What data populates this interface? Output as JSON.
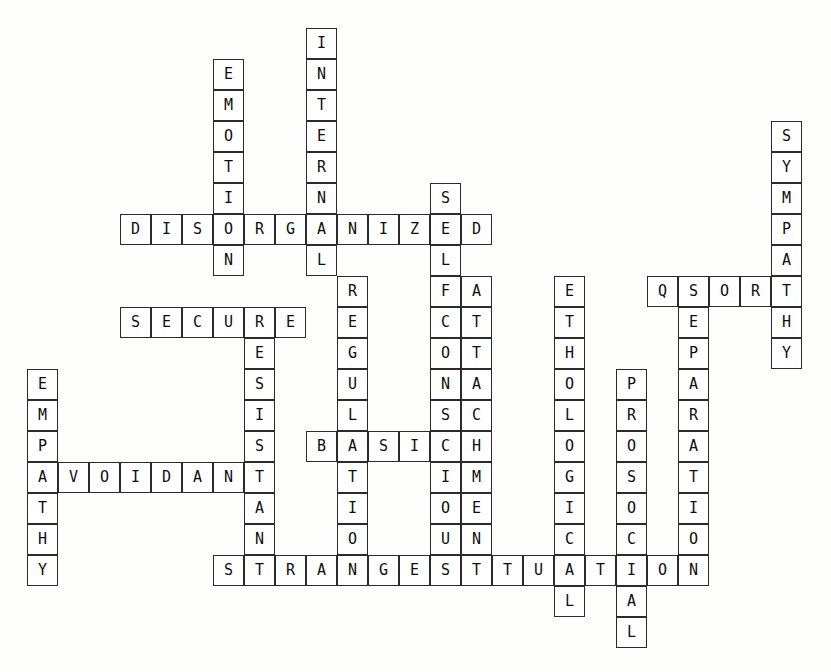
{
  "puzzle": {
    "kind": "crossword-grid",
    "title": "Attachment Theory Crossword",
    "cell_size": 31,
    "origin_x": 27,
    "origin_y": 28,
    "cols": 26,
    "rows": 20,
    "colors": {
      "page_background": "#fdfdfc",
      "cell_background": "#ffffff",
      "cell_border": "#2b2b2b",
      "letter_color": "#0d0d0d"
    },
    "entries": [
      {
        "answer": "INTERNAL",
        "direction": "down",
        "row": 0,
        "col": 9
      },
      {
        "answer": "EMOTION",
        "direction": "down",
        "row": 1,
        "col": 6
      },
      {
        "answer": "SELFCONSCIOUS",
        "direction": "down",
        "row": 5,
        "col": 13
      },
      {
        "answer": "DISORGANIZED",
        "direction": "across",
        "row": 6,
        "col": 3
      },
      {
        "answer": "SYMPATHY",
        "direction": "down",
        "row": 3,
        "col": 24
      },
      {
        "answer": "QSORT",
        "direction": "across",
        "row": 8,
        "col": 20
      },
      {
        "answer": "SEPARATION",
        "direction": "down",
        "row": 8,
        "col": 21
      },
      {
        "answer": "ATTACHMENT",
        "direction": "down",
        "row": 8,
        "col": 14
      },
      {
        "answer": "ETHOLOGICAL",
        "direction": "down",
        "row": 8,
        "col": 17
      },
      {
        "answer": "REGULATION",
        "direction": "down",
        "row": 8,
        "col": 10
      },
      {
        "answer": "SECURE",
        "direction": "across",
        "row": 9,
        "col": 3
      },
      {
        "answer": "RESISTANT",
        "direction": "down",
        "row": 9,
        "col": 7
      },
      {
        "answer": "EMPATHY",
        "direction": "down",
        "row": 11,
        "col": 0
      },
      {
        "answer": "PROSOCIAL",
        "direction": "down",
        "row": 11,
        "col": 19
      },
      {
        "answer": "BASIC",
        "direction": "across",
        "row": 13,
        "col": 9
      },
      {
        "answer": "AVOIDANT",
        "direction": "across",
        "row": 14,
        "col": 0
      },
      {
        "answer": "STRANGESITUATION",
        "direction": "across",
        "row": 17,
        "col": 6
      }
    ]
  }
}
